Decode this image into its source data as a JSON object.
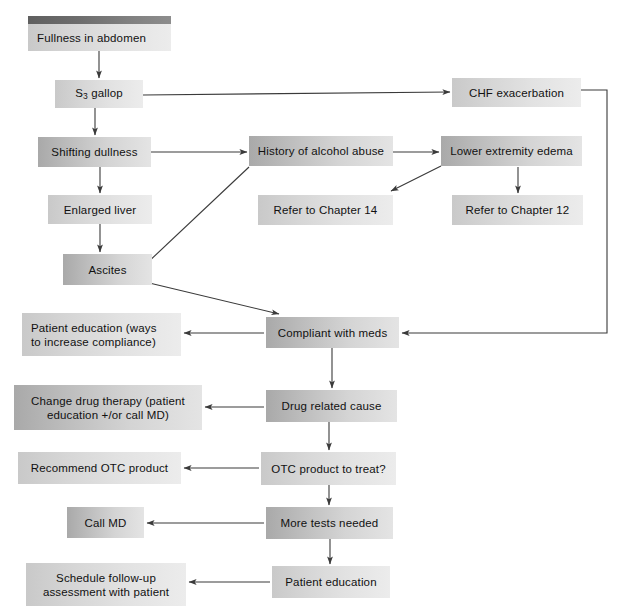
{
  "diagram": {
    "type": "flowchart",
    "colors": {
      "box_gradient_start": "#b4b4b4",
      "box_gradient_end": "#ebebeb",
      "header_bar_start": "#5f5f5f",
      "header_bar_end": "#8d8d8d",
      "line": "#3a3a3a",
      "text": "#111111",
      "background": "#ffffff"
    },
    "nodes": [
      {
        "id": "fullness",
        "label": "Fullness in abdomen",
        "x": 28,
        "y": 24,
        "w": 143,
        "h": 27,
        "shade": "light",
        "align": "left",
        "has_header_bar": true
      },
      {
        "id": "s3gallop",
        "label": "S3 gallop",
        "x": 55,
        "y": 80,
        "w": 88,
        "h": 28,
        "shade": "light",
        "align": "center",
        "has_header_bar": false,
        "subscript": true
      },
      {
        "id": "chf",
        "label": "CHF exacerbation",
        "x": 452,
        "y": 78,
        "w": 129,
        "h": 29,
        "shade": "light",
        "align": "center",
        "has_header_bar": false
      },
      {
        "id": "shifting",
        "label": "Shifting dullness",
        "x": 38,
        "y": 137,
        "w": 113,
        "h": 30,
        "shade": "dark",
        "align": "center",
        "has_header_bar": false
      },
      {
        "id": "history",
        "label": "History of alcohol abuse",
        "x": 249,
        "y": 136,
        "w": 144,
        "h": 30,
        "shade": "dark",
        "align": "center",
        "has_header_bar": false
      },
      {
        "id": "edema",
        "label": "Lower extremity edema",
        "x": 441,
        "y": 136,
        "w": 141,
        "h": 30,
        "shade": "dark",
        "align": "center",
        "has_header_bar": false
      },
      {
        "id": "enlarged",
        "label": "Enlarged liver",
        "x": 48,
        "y": 195,
        "w": 104,
        "h": 29,
        "shade": "light",
        "align": "center",
        "has_header_bar": false
      },
      {
        "id": "chapter14",
        "label": "Refer to Chapter 14",
        "x": 258,
        "y": 195,
        "w": 135,
        "h": 30,
        "shade": "light",
        "align": "center",
        "has_header_bar": false
      },
      {
        "id": "chapter12",
        "label": "Refer to Chapter 12",
        "x": 452,
        "y": 195,
        "w": 131,
        "h": 30,
        "shade": "light",
        "align": "center",
        "has_header_bar": false
      },
      {
        "id": "ascites",
        "label": "Ascites",
        "x": 63,
        "y": 254,
        "w": 89,
        "h": 31,
        "shade": "dark",
        "align": "center",
        "has_header_bar": false
      },
      {
        "id": "patedu1",
        "label": "Patient education (ways\nto increase compliance)",
        "x": 22,
        "y": 313,
        "w": 159,
        "h": 43,
        "shade": "light",
        "align": "left",
        "has_header_bar": false
      },
      {
        "id": "compliant",
        "label": "Compliant with meds",
        "x": 266,
        "y": 317,
        "w": 133,
        "h": 31,
        "shade": "dark",
        "align": "center",
        "has_header_bar": false
      },
      {
        "id": "changedrug",
        "label": "Change drug therapy (patient\neducation +/or call MD)",
        "x": 14,
        "y": 385,
        "w": 188,
        "h": 45,
        "shade": "dark",
        "align": "center",
        "has_header_bar": false
      },
      {
        "id": "drugcause",
        "label": "Drug related cause",
        "x": 266,
        "y": 390,
        "w": 131,
        "h": 32,
        "shade": "dark",
        "align": "center",
        "has_header_bar": false
      },
      {
        "id": "recotc",
        "label": "Recommend OTC product",
        "x": 18,
        "y": 452,
        "w": 163,
        "h": 32,
        "shade": "light",
        "align": "center",
        "has_header_bar": false
      },
      {
        "id": "otctreat",
        "label": "OTC product to treat?",
        "x": 261,
        "y": 452,
        "w": 135,
        "h": 33,
        "shade": "light",
        "align": "center",
        "has_header_bar": false
      },
      {
        "id": "callmd",
        "label": "Call MD",
        "x": 67,
        "y": 507,
        "w": 77,
        "h": 31,
        "shade": "dark",
        "align": "center",
        "has_header_bar": false
      },
      {
        "id": "moretests",
        "label": "More tests needed",
        "x": 266,
        "y": 507,
        "w": 127,
        "h": 32,
        "shade": "dark",
        "align": "center",
        "has_header_bar": false
      },
      {
        "id": "schedule",
        "label": "Schedule follow-up\nassessment with patient",
        "x": 26,
        "y": 563,
        "w": 160,
        "h": 43,
        "shade": "light",
        "align": "center",
        "has_header_bar": false
      },
      {
        "id": "patedu2",
        "label": "Patient education",
        "x": 272,
        "y": 566,
        "w": 118,
        "h": 32,
        "shade": "light",
        "align": "center",
        "has_header_bar": false
      }
    ],
    "edges": [
      {
        "id": "e1",
        "from": "fullness",
        "to": "s3gallop",
        "kind": "straight"
      },
      {
        "id": "e2",
        "from": "s3gallop",
        "to": "chf",
        "kind": "straight"
      },
      {
        "id": "e3",
        "from": "s3gallop",
        "to": "shifting",
        "kind": "straight"
      },
      {
        "id": "e4",
        "from": "shifting",
        "to": "history",
        "kind": "straight"
      },
      {
        "id": "e5",
        "from": "history",
        "to": "edema",
        "kind": "straight"
      },
      {
        "id": "e6",
        "from": "shifting",
        "to": "enlarged",
        "kind": "straight"
      },
      {
        "id": "e7",
        "from": "edema",
        "to": "chapter14",
        "kind": "diagonal"
      },
      {
        "id": "e8",
        "from": "edema",
        "to": "chapter12",
        "kind": "straight"
      },
      {
        "id": "e9",
        "from": "enlarged",
        "to": "ascites",
        "kind": "straight"
      },
      {
        "id": "e10",
        "from": "history",
        "to": "ascites",
        "kind": "diagonal"
      },
      {
        "id": "e11",
        "from": "ascites",
        "to": "compliant",
        "kind": "diagonal"
      },
      {
        "id": "e12",
        "from": "chf",
        "to": "compliant",
        "kind": "orthogonal"
      },
      {
        "id": "e13",
        "from": "compliant",
        "to": "patedu1",
        "kind": "straight"
      },
      {
        "id": "e14",
        "from": "compliant",
        "to": "drugcause",
        "kind": "straight"
      },
      {
        "id": "e15",
        "from": "drugcause",
        "to": "changedrug",
        "kind": "straight"
      },
      {
        "id": "e16",
        "from": "drugcause",
        "to": "otctreat",
        "kind": "straight"
      },
      {
        "id": "e17",
        "from": "otctreat",
        "to": "recotc",
        "kind": "straight"
      },
      {
        "id": "e18",
        "from": "otctreat",
        "to": "moretests",
        "kind": "straight"
      },
      {
        "id": "e19",
        "from": "moretests",
        "to": "callmd",
        "kind": "straight"
      },
      {
        "id": "e20",
        "from": "moretests",
        "to": "patedu2",
        "kind": "straight"
      },
      {
        "id": "e21",
        "from": "patedu2",
        "to": "schedule",
        "kind": "straight"
      }
    ]
  }
}
